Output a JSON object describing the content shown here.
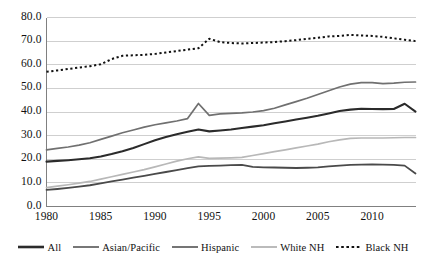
{
  "chart_data": {
    "type": "line",
    "title": "",
    "subtitle": "",
    "xlabel": "",
    "ylabel": "",
    "xlim": [
      1980,
      2014
    ],
    "ylim": [
      0.0,
      80.0
    ],
    "grid": true,
    "legend_position": "bottom",
    "x": [
      1980,
      1981,
      1982,
      1983,
      1984,
      1985,
      1986,
      1987,
      1988,
      1989,
      1990,
      1991,
      1992,
      1993,
      1994,
      1995,
      1996,
      1997,
      1998,
      1999,
      2000,
      2001,
      2002,
      2003,
      2004,
      2005,
      2006,
      2007,
      2008,
      2009,
      2010,
      2011,
      2012,
      2013,
      2014
    ],
    "y_ticks": [
      "0.0",
      "10.0",
      "20.0",
      "30.0",
      "40.0",
      "50.0",
      "60.0",
      "70.0",
      "80.0"
    ],
    "y_tick_values": [
      0.0,
      10.0,
      20.0,
      30.0,
      40.0,
      50.0,
      60.0,
      70.0,
      80.0
    ],
    "x_ticks": [
      "1980",
      "1985",
      "1990",
      "1995",
      "2000",
      "2005",
      "2010"
    ],
    "x_tick_values": [
      1980,
      1985,
      1990,
      1995,
      2000,
      2005,
      2010
    ],
    "series": [
      {
        "name": "All",
        "color": "#2b2b2b",
        "width": 2.1,
        "dash": "none",
        "values": [
          19.0,
          19.3,
          19.6,
          20.0,
          20.4,
          21.2,
          22.2,
          23.4,
          24.8,
          26.4,
          28.0,
          29.4,
          30.6,
          31.6,
          32.6,
          31.8,
          32.2,
          32.6,
          33.2,
          33.8,
          34.4,
          35.2,
          36.0,
          36.8,
          37.6,
          38.4,
          39.4,
          40.4,
          41.0,
          41.4,
          41.3,
          41.2,
          41.3,
          43.5,
          40.2
        ]
      },
      {
        "name": "Asian/Pacific",
        "color": "#707070",
        "width": 1.7,
        "dash": "none",
        "values": [
          24.0,
          24.6,
          25.2,
          26.0,
          27.0,
          28.4,
          29.8,
          31.2,
          32.4,
          33.6,
          34.6,
          35.4,
          36.2,
          37.2,
          43.6,
          38.6,
          39.2,
          39.4,
          39.6,
          40.0,
          40.6,
          41.6,
          43.0,
          44.4,
          45.8,
          47.4,
          49.0,
          50.6,
          51.8,
          52.4,
          52.4,
          52.0,
          52.2,
          52.6,
          52.7
        ]
      },
      {
        "name": "Hispanic",
        "color": "#4a4a4a",
        "width": 1.8,
        "dash": "none",
        "values": [
          7.0,
          7.4,
          7.9,
          8.4,
          9.0,
          9.8,
          10.6,
          11.4,
          12.2,
          13.0,
          13.8,
          14.6,
          15.4,
          16.2,
          17.0,
          17.2,
          17.3,
          17.5,
          17.6,
          16.8,
          16.6,
          16.5,
          16.4,
          16.3,
          16.4,
          16.6,
          17.0,
          17.3,
          17.6,
          17.7,
          17.8,
          17.7,
          17.6,
          17.3,
          14.0
        ]
      },
      {
        "name": "White NH",
        "color": "#b8b8b8",
        "width": 1.7,
        "dash": "none",
        "values": [
          8.0,
          8.6,
          9.2,
          9.9,
          10.6,
          11.6,
          12.6,
          13.6,
          14.6,
          15.6,
          16.8,
          18.0,
          19.2,
          20.2,
          21.0,
          20.4,
          20.5,
          20.6,
          20.8,
          21.6,
          22.4,
          23.2,
          24.0,
          24.8,
          25.6,
          26.4,
          27.4,
          28.2,
          28.8,
          29.0,
          29.0,
          29.0,
          29.1,
          29.2,
          29.2
        ]
      },
      {
        "name": "Black NH",
        "color": "#111111",
        "width": 2.0,
        "dash": "2.2 2.6",
        "values": [
          57.0,
          57.6,
          58.2,
          58.8,
          59.4,
          60.2,
          62.4,
          63.8,
          64.0,
          64.2,
          64.6,
          65.2,
          65.8,
          66.4,
          67.0,
          71.0,
          69.6,
          69.2,
          69.0,
          69.2,
          69.4,
          69.6,
          70.0,
          70.4,
          71.0,
          71.4,
          72.0,
          72.2,
          72.6,
          72.4,
          72.2,
          71.8,
          71.2,
          70.6,
          70.0
        ]
      }
    ],
    "legend": [
      {
        "label": "All",
        "color": "#2b2b2b",
        "width": 2.6,
        "dash": "none"
      },
      {
        "label": "Asian/Pacific",
        "color": "#707070",
        "width": 1.9,
        "dash": "none"
      },
      {
        "label": "Hispanic",
        "color": "#6e6e6e",
        "width": 1.9,
        "dash": "none"
      },
      {
        "label": "White NH",
        "color": "#b8b8b8",
        "width": 1.9,
        "dash": "none"
      },
      {
        "label": "Black NH",
        "color": "#111111",
        "width": 2.2,
        "dash": "2.6 2.6"
      }
    ],
    "colors": {
      "gridline": "#cfcfcf",
      "axis": "#808080",
      "background": "#ffffff",
      "text": "#111111"
    }
  }
}
